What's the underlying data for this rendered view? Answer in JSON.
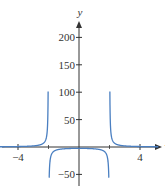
{
  "chart_data": {
    "type": "line",
    "title": "",
    "xlabel": "x",
    "ylabel": "y",
    "xlim": [
      -5.2,
      5.2
    ],
    "ylim": [
      -50,
      200
    ],
    "x_ticks": [
      -4,
      4
    ],
    "x_tick_labels": [
      "−4",
      "4"
    ],
    "y_ticks": [
      -50,
      50,
      100,
      150,
      200
    ],
    "y_tick_labels": [
      "−50",
      "50",
      "100",
      "150",
      "200"
    ],
    "grid": false,
    "legend": null,
    "vertical_asymptotes": [
      -2,
      2
    ],
    "series": [
      {
        "name": "f(x)",
        "color": "#4a7fc1",
        "description": "Rational function with vertical asymptotes at x = -2 and x = 2; approaches 0 as |x| grows; tends to +infinity as |x| approaches 2 from outside and to -infinity from inside",
        "x": [
          -5.2,
          -4,
          -3,
          -2.5,
          -2.2,
          -2.1,
          -2.05,
          -2.02,
          -1.98,
          -1.95,
          -1.9,
          -1.5,
          -1,
          0,
          1,
          1.5,
          1.9,
          1.95,
          1.98,
          2.02,
          2.05,
          2.1,
          2.2,
          2.5,
          3,
          4,
          5.2
        ],
        "y": [
          0.3,
          0.7,
          1.6,
          4.4,
          9.5,
          19.5,
          39.5,
          99.5,
          -100.5,
          -40.5,
          -20.5,
          -5.7,
          -3.3,
          -2.5,
          -3.3,
          -5.7,
          -20.5,
          -40.5,
          -100.5,
          99.5,
          39.5,
          19.5,
          9.5,
          4.4,
          1.6,
          0.7,
          0.3
        ]
      }
    ]
  },
  "axes": {
    "x_label": "x",
    "y_label": "y"
  }
}
